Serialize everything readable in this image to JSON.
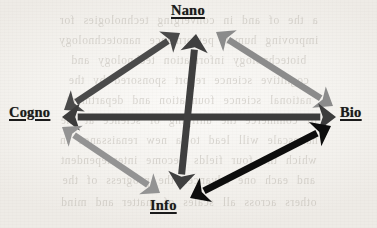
{
  "figure": {
    "background_color": "#f2f0ec",
    "ghost_text_lines": [
      "a the of and in converging technologies for",
      "improving human performance nanotechnology",
      "biotechnology information technology and",
      "cognitive science report sponsored by the",
      "national science foundation and department",
      "of commerce the unifying of science at the",
      "nanoscale will lead to a new renaissance in",
      "which the four fields become interdependent",
      "and each one advances the progress of the",
      "others across all scales of matter and mind"
    ]
  },
  "nodes": [
    {
      "id": "nano",
      "label": "Nano",
      "x": 198,
      "y": 15,
      "color": "#1a1a1a"
    },
    {
      "id": "cogno",
      "label": "Cogno",
      "x": 37,
      "y": 116,
      "color": "#1a1a1a"
    },
    {
      "id": "bio",
      "label": "Bio",
      "x": 353,
      "y": 116,
      "color": "#1a1a1a"
    },
    {
      "id": "info",
      "label": "Info",
      "x": 171,
      "y": 209,
      "color": "#1a1a1a"
    }
  ],
  "edges": [
    {
      "id": "cogno-nano",
      "from": "Cogno",
      "to": "Nano",
      "direction": "bidirectional",
      "color": "#4a4a4a",
      "shade": "dark-gray",
      "width": 6.5,
      "x1": 64,
      "y1": 110,
      "x2": 180,
      "y2": 33
    },
    {
      "id": "nano-bio",
      "from": "Nano",
      "to": "Bio",
      "direction": "bidirectional",
      "color": "#8b8b8b",
      "shade": "light-gray",
      "width": 6.5,
      "x1": 216,
      "y1": 32,
      "x2": 333,
      "y2": 106
    },
    {
      "id": "cogno-bio",
      "from": "Cogno",
      "to": "Bio",
      "direction": "bidirectional",
      "color": "#3c3c3c",
      "shade": "dark-gray",
      "width": 7,
      "x1": 62,
      "y1": 117,
      "x2": 336,
      "y2": 117
    },
    {
      "id": "nano-info",
      "from": "Nano",
      "to": "Info",
      "direction": "bidirectional",
      "color": "#3f3f3f",
      "shade": "dark-gray",
      "width": 7,
      "x1": 196,
      "y1": 34,
      "x2": 180,
      "y2": 190
    },
    {
      "id": "cogno-info",
      "from": "Cogno",
      "to": "Info",
      "direction": "bidirectional",
      "color": "#939393",
      "shade": "light-gray",
      "width": 6.5,
      "x1": 62,
      "y1": 127,
      "x2": 160,
      "y2": 193
    },
    {
      "id": "info-bio",
      "from": "Info",
      "to": "Bio",
      "direction": "bidirectional",
      "color": "#0d0d0d",
      "shade": "black",
      "width": 7,
      "x1": 190,
      "y1": 198,
      "x2": 331,
      "y2": 126
    }
  ]
}
